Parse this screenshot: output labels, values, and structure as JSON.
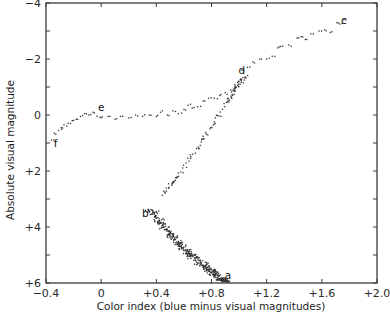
{
  "chart_data": {
    "type": "scatter",
    "title": "",
    "xlabel": "Color index (blue minus visual magnitudes)",
    "ylabel": "Absolute visual magnitude",
    "xlim": [
      -0.4,
      2.0
    ],
    "ylim": [
      6,
      -4
    ],
    "y_inverted": true,
    "grid": false,
    "legend": null,
    "x_ticks": [
      -0.4,
      0,
      0.4,
      0.8,
      1.2,
      1.6,
      2.0
    ],
    "x_tick_labels": [
      "−0.4",
      "0",
      "+0.4",
      "+0.8",
      "+1.2",
      "+1.6",
      "+2.0"
    ],
    "y_ticks": [
      -4,
      -2,
      0,
      2,
      4,
      6
    ],
    "y_tick_labels": [
      "−4",
      "−2",
      "0",
      "+2",
      "+4",
      "+6"
    ],
    "minor_y_ticks": [
      -3,
      -1,
      1,
      3,
      5
    ],
    "annotations": [
      {
        "text": "a",
        "x": 0.92,
        "y": 5.7
      },
      {
        "text": "b",
        "x": 0.32,
        "y": 3.5
      },
      {
        "text": "c",
        "x": 1.76,
        "y": -3.4
      },
      {
        "text": "d",
        "x": 1.02,
        "y": -1.6
      },
      {
        "text": "e",
        "x": 0.0,
        "y": -0.3
      },
      {
        "text": "f",
        "x": -0.33,
        "y": 1.0
      }
    ],
    "series": [
      {
        "name": "main sequence (a-b)",
        "description": "dense band from b (~0.38, 3.4) down to a (~0.9, 6.0)",
        "centerline": [
          [
            0.36,
            3.4
          ],
          [
            0.45,
            4.0
          ],
          [
            0.55,
            4.5
          ],
          [
            0.65,
            5.0
          ],
          [
            0.75,
            5.4
          ],
          [
            0.85,
            5.8
          ],
          [
            0.92,
            6.0
          ]
        ],
        "spread_x": 0.06,
        "count": 420
      },
      {
        "name": "subgiant branch (b-d)",
        "description": "narrow branch rising from b (~0.4, 3.2) to d (~1.05, -1.4)",
        "centerline": [
          [
            0.42,
            3.0
          ],
          [
            0.55,
            2.2
          ],
          [
            0.7,
            1.2
          ],
          [
            0.8,
            0.4
          ],
          [
            0.9,
            -0.4
          ],
          [
            0.98,
            -1.0
          ],
          [
            1.05,
            -1.4
          ]
        ],
        "spread_x": 0.03,
        "count": 110
      },
      {
        "name": "red giant branch (d-c)",
        "description": "sparse sequence from d (~1.0, -1.5) to c (~1.7, -3.3)",
        "points": [
          [
            1.02,
            -1.6
          ],
          [
            1.06,
            -1.7
          ],
          [
            1.1,
            -1.9
          ],
          [
            1.15,
            -2.0
          ],
          [
            1.2,
            -2.0
          ],
          [
            1.24,
            -2.1
          ],
          [
            1.28,
            -2.4
          ],
          [
            1.3,
            -2.45
          ],
          [
            1.36,
            -2.5
          ],
          [
            1.42,
            -2.75
          ],
          [
            1.45,
            -2.8
          ],
          [
            1.48,
            -2.7
          ],
          [
            1.52,
            -2.9
          ],
          [
            1.58,
            -3.0
          ],
          [
            1.62,
            -3.05
          ],
          [
            1.66,
            -2.95
          ],
          [
            1.71,
            -3.3
          ],
          [
            1.73,
            -3.25
          ],
          [
            1.76,
            -3.4
          ]
        ],
        "count": 19
      },
      {
        "name": "horizontal branch (e-d)",
        "description": "sequence from e (~0.0, 0.0) rising to d (~1.0, -1.4)",
        "points": [
          [
            0.0,
            0.1
          ],
          [
            0.05,
            0.05
          ],
          [
            0.1,
            0.15
          ],
          [
            0.14,
            0.05
          ],
          [
            0.2,
            0.1
          ],
          [
            0.25,
            0.0
          ],
          [
            0.3,
            0.05
          ],
          [
            0.35,
            0.0
          ],
          [
            0.4,
            0.05
          ],
          [
            0.43,
            -0.1
          ],
          [
            0.48,
            0.0
          ],
          [
            0.52,
            -0.15
          ],
          [
            0.56,
            -0.05
          ],
          [
            0.6,
            -0.2
          ],
          [
            0.63,
            -0.35
          ],
          [
            0.66,
            -0.25
          ],
          [
            0.7,
            -0.3
          ],
          [
            0.74,
            -0.5
          ],
          [
            0.78,
            -0.6
          ],
          [
            0.82,
            -0.6
          ],
          [
            0.86,
            -0.7
          ],
          [
            0.9,
            -0.8
          ],
          [
            0.94,
            -0.9
          ],
          [
            0.98,
            -1.0
          ],
          [
            1.0,
            -1.2
          ]
        ],
        "count": 25
      },
      {
        "name": "blue horizontal branch (f-e)",
        "description": "short tail from f (~-0.35, 1.0) up to e (~-0.05, -0.1)",
        "points": [
          [
            -0.36,
            0.9
          ],
          [
            -0.34,
            0.65
          ],
          [
            -0.31,
            0.55
          ],
          [
            -0.29,
            0.45
          ],
          [
            -0.27,
            0.35
          ],
          [
            -0.24,
            0.3
          ],
          [
            -0.21,
            0.2
          ],
          [
            -0.18,
            0.15
          ],
          [
            -0.15,
            0.05
          ],
          [
            -0.12,
            -0.05
          ],
          [
            -0.09,
            0.0
          ],
          [
            -0.06,
            -0.1
          ],
          [
            -0.03,
            0.05
          ]
        ],
        "count": 13
      }
    ]
  }
}
